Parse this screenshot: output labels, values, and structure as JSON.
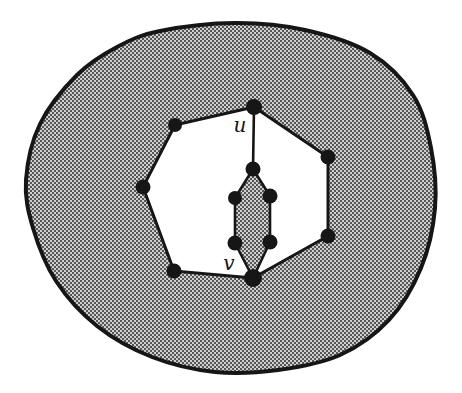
{
  "figure": {
    "labels": {
      "u": "u",
      "v": "v"
    },
    "colors": {
      "ink": "#161616",
      "stipple_light": "#cfcfcf",
      "stipple_dark": "#565656",
      "face_fill": "#ffffff",
      "page_background": "#ffffff"
    },
    "canvas": {
      "width": 462,
      "height": 393
    },
    "outer_region_outline": [
      [
        160,
        31
      ],
      [
        235,
        23
      ],
      [
        305,
        30
      ],
      [
        370,
        53
      ],
      [
        413,
        95
      ],
      [
        431,
        148
      ],
      [
        435,
        208
      ],
      [
        421,
        268
      ],
      [
        389,
        320
      ],
      [
        340,
        355
      ],
      [
        278,
        370
      ],
      [
        215,
        372
      ],
      [
        152,
        357
      ],
      [
        97,
        326
      ],
      [
        56,
        281
      ],
      [
        33,
        228
      ],
      [
        26,
        180
      ],
      [
        40,
        124
      ],
      [
        77,
        75
      ],
      [
        117,
        47
      ]
    ],
    "face_polygon": [
      [
        254,
        107
      ],
      [
        328,
        157
      ],
      [
        328,
        236
      ],
      [
        253,
        278
      ],
      [
        174,
        271
      ],
      [
        143,
        187
      ],
      [
        175,
        125
      ]
    ],
    "inner_cycle_polygon": [
      [
        253,
        169
      ],
      [
        270,
        196
      ],
      [
        270,
        242
      ],
      [
        253,
        278
      ],
      [
        235,
        243
      ],
      [
        235,
        198
      ]
    ],
    "edge_u_to_inner": {
      "x1": 254,
      "y1": 107,
      "x2": 253,
      "y2": 169
    },
    "vertices": [
      {
        "name": "vertex-u",
        "x": 254,
        "y": 107,
        "r": 8
      },
      {
        "name": "vertex-face-top-left",
        "x": 175,
        "y": 125,
        "r": 7
      },
      {
        "name": "vertex-face-left",
        "x": 143,
        "y": 187,
        "r": 7.5
      },
      {
        "name": "vertex-face-bottom-left",
        "x": 174,
        "y": 271,
        "r": 7.5
      },
      {
        "name": "vertex-v",
        "x": 253,
        "y": 278,
        "r": 9
      },
      {
        "name": "vertex-face-bottom-right",
        "x": 328,
        "y": 236,
        "r": 7.5
      },
      {
        "name": "vertex-face-right",
        "x": 328,
        "y": 157,
        "r": 7.5
      },
      {
        "name": "vertex-path-top",
        "x": 253,
        "y": 169,
        "r": 7.5
      },
      {
        "name": "vertex-cycle-upper-left",
        "x": 235,
        "y": 198,
        "r": 7
      },
      {
        "name": "vertex-cycle-upper-right",
        "x": 270,
        "y": 196,
        "r": 7.5
      },
      {
        "name": "vertex-cycle-lower-left",
        "x": 235,
        "y": 243,
        "r": 7.5
      },
      {
        "name": "vertex-cycle-lower-right",
        "x": 270,
        "y": 242,
        "r": 7.5
      }
    ],
    "label_positions": {
      "u": {
        "x": 240,
        "y": 132
      },
      "v": {
        "x": 229,
        "y": 270
      }
    },
    "stroke_widths": {
      "outer": 4,
      "face": 3,
      "inner": 2.6,
      "edge": 2.6
    }
  }
}
